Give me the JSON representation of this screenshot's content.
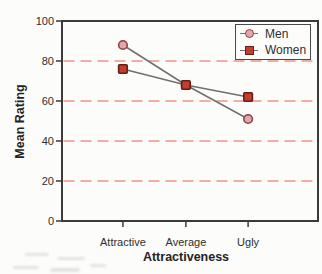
{
  "colors": {
    "paper": "#fcfcfa",
    "axis": "#3a3a3a",
    "grid": "#ec9488",
    "series_line": "#707070",
    "text": "#2e2e2e"
  },
  "chart_data": {
    "type": "line",
    "title": "",
    "xlabel": "Attractiveness",
    "ylabel": "Mean Rating",
    "categories": [
      "Attractive",
      "Average",
      "Ugly"
    ],
    "series": [
      {
        "name": "Men",
        "marker": "circle",
        "fill": "#e2a7ad",
        "stroke": "#8e4040",
        "values": [
          88,
          68,
          51
        ]
      },
      {
        "name": "Women",
        "marker": "square",
        "fill": "#c23e2d",
        "stroke": "#661f18",
        "values": [
          76,
          68,
          62
        ]
      }
    ],
    "ylim": [
      0,
      100
    ],
    "yticks": [
      0,
      20,
      40,
      60,
      80,
      100
    ],
    "gridlines_y": [
      20,
      40,
      60,
      80
    ],
    "grid_style": "dashed",
    "legend_position": "top-right",
    "category_fractions": [
      0.238,
      0.484,
      0.727
    ]
  }
}
